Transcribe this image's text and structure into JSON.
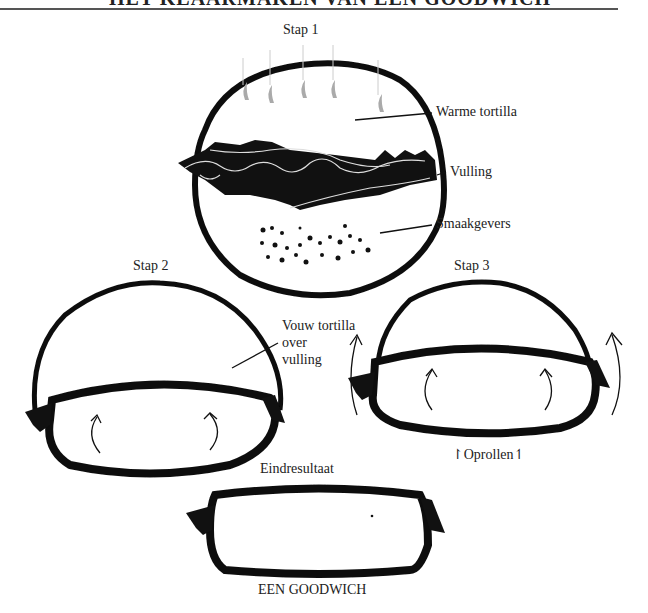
{
  "header": {
    "title": "HET KLAARMAKEN VAN EEN GOODWICH"
  },
  "steps": [
    {
      "label": "Stap 1",
      "annotations": [
        "Warme tortilla",
        "Vulling",
        "Smaakgevers"
      ]
    },
    {
      "label": "Stap 2",
      "annotations": [
        "Vouw tortilla",
        "over",
        "vulling"
      ]
    },
    {
      "label": "Stap 3",
      "annotations": [
        "Oprollen"
      ]
    },
    {
      "label": "Eindresultaat",
      "annotations": [
        "EEN GOODWICH"
      ]
    }
  ],
  "colors": {
    "ink": "#111111",
    "steam": "#aaaaaa",
    "background": "#ffffff"
  }
}
